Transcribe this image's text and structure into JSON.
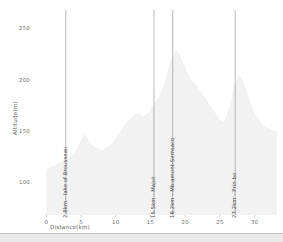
{
  "chart_data": {
    "type": "area",
    "title": "",
    "xlabel": "Distance(km)",
    "ylabel": "Altitude(m)",
    "xlim": [
      -1.2,
      33.8
    ],
    "ylim": [
      68,
      268
    ],
    "grid": false,
    "legend": null,
    "xticks": [
      0,
      5,
      10,
      15,
      20,
      25,
      30
    ],
    "xtick_labels": [
      "0",
      "5",
      "10",
      "15",
      "20",
      "25",
      "30"
    ],
    "yticks": [
      100,
      150,
      200,
      250
    ],
    "ytick_labels": [
      "100",
      "150",
      "200",
      "250"
    ],
    "series": [
      {
        "name": "Altitude profile",
        "fill_color": "#f2f2f2",
        "line_color": "#ededed",
        "x": [
          0.0,
          0.6,
          1.2,
          1.8,
          2.4,
          2.8,
          3.2,
          3.8,
          4.4,
          5.0,
          5.4,
          5.8,
          6.2,
          6.8,
          7.4,
          8.0,
          8.6,
          9.2,
          9.8,
          10.4,
          11.0,
          11.6,
          12.2,
          12.8,
          13.4,
          14.0,
          14.6,
          15.0,
          15.5,
          16.0,
          16.5,
          17.0,
          17.4,
          17.8,
          18.2,
          18.6,
          19.0,
          19.4,
          19.8,
          20.2,
          20.8,
          21.4,
          22.0,
          22.6,
          23.2,
          23.8,
          24.4,
          25.0,
          25.6,
          26.2,
          26.8,
          27.2,
          27.8,
          28.4,
          29.0,
          29.6,
          30.2,
          30.8,
          31.4,
          32.0,
          32.6,
          33.2
        ],
        "y": [
          112,
          114,
          116,
          118,
          120,
          121,
          122,
          126,
          131,
          140,
          146,
          143,
          138,
          134,
          132,
          131,
          133,
          136,
          140,
          146,
          152,
          158,
          162,
          166,
          166,
          164,
          166,
          170,
          176,
          180,
          186,
          194,
          204,
          214,
          222,
          228,
          226,
          220,
          214,
          208,
          200,
          196,
          190,
          184,
          178,
          172,
          166,
          160,
          158,
          168,
          182,
          196,
          204,
          196,
          184,
          172,
          164,
          158,
          154,
          152,
          150,
          149
        ]
      }
    ],
    "annotations": [
      {
        "x": 2.8,
        "label": "2.8km - lake of Brousseau",
        "color": "#9a9a9a"
      },
      {
        "x": 15.5,
        "label": "15.5km - Majot",
        "color": "#9a9a9a"
      },
      {
        "x": 18.2,
        "label": "18.2km - Mb:amont-Semsacq",
        "color": "#9a9a9a"
      },
      {
        "x": 27.2,
        "label": "27.2km - Prin bo",
        "color": "#9a9a9a"
      }
    ]
  },
  "axes": {
    "xlabel": "Distance(km)",
    "ylabel": "Altitude(m)"
  }
}
